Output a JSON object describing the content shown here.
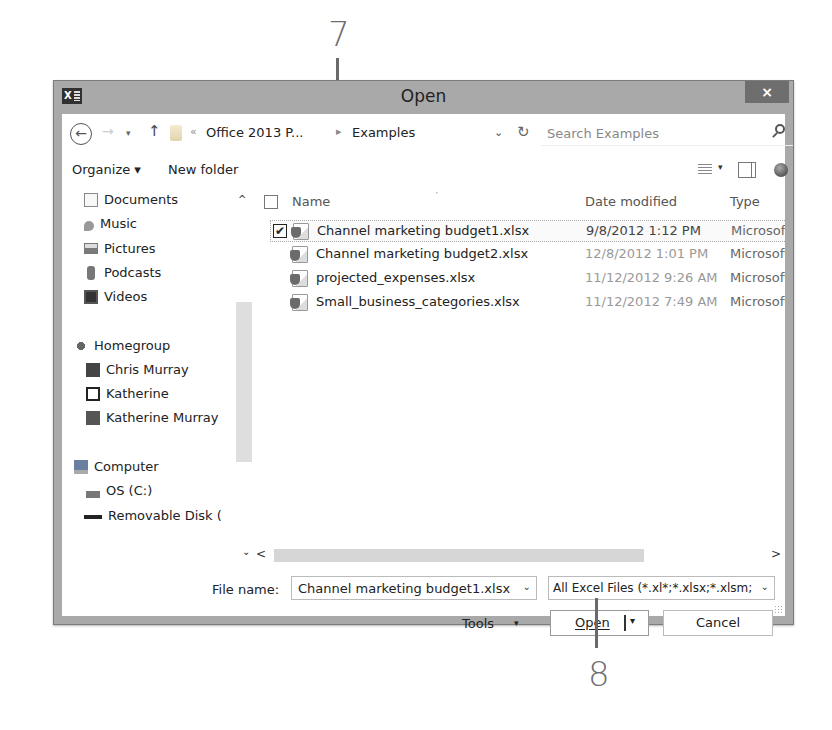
{
  "callouts": [
    {
      "number": "7",
      "target": "selected-file"
    },
    {
      "number": "8",
      "target": "open-button"
    }
  ],
  "window": {
    "title": "Open",
    "app_icon": "excel-icon",
    "close_label": "×"
  },
  "navbar": {
    "back_icon": "←",
    "forward_icon": "→",
    "recent_icon": "▾",
    "up_icon": "↑",
    "overflow": "«",
    "breadcrumbs": [
      "Office 2013 P...",
      "Examples"
    ],
    "separator": "▸",
    "dropdown_icon": "⌄",
    "refresh_icon": "↻",
    "search_placeholder": "Search Examples"
  },
  "toolbar": {
    "organize": "Organize ▾",
    "new_folder": "New folder",
    "view_dropdown": "▾"
  },
  "nav_pane": {
    "collapse_icon": "^",
    "items": [
      {
        "label": "Documents",
        "icon": "documents-icon",
        "indent": 1
      },
      {
        "label": "Music",
        "icon": "music-icon",
        "indent": 1
      },
      {
        "label": "Pictures",
        "icon": "pictures-icon",
        "indent": 1
      },
      {
        "label": "Podcasts",
        "icon": "podcasts-icon",
        "indent": 1
      },
      {
        "label": "Videos",
        "icon": "videos-icon",
        "indent": 1
      },
      {
        "label": "Homegroup",
        "icon": "homegroup-icon",
        "indent": 0
      },
      {
        "label": "Chris Murray",
        "icon": "user-icon",
        "indent": 1
      },
      {
        "label": "Katherine",
        "icon": "user-icon",
        "indent": 1
      },
      {
        "label": "Katherine Murray",
        "icon": "user-icon",
        "indent": 1
      },
      {
        "label": "Computer",
        "icon": "computer-icon",
        "indent": 0
      },
      {
        "label": "OS (C:)",
        "icon": "drive-icon",
        "indent": 1
      },
      {
        "label": "Removable Disk (",
        "icon": "usb-drive-icon",
        "indent": 1
      }
    ],
    "scroll_down_icon": "⌄"
  },
  "file_list": {
    "columns": [
      "Name",
      "Date modified",
      "Type"
    ],
    "files": [
      {
        "name": "Channel marketing budget1.xlsx",
        "date": "9/8/2012 1:12 PM",
        "type": "Microsoft",
        "selected": true,
        "checkmark": "✔"
      },
      {
        "name": "Channel marketing budget2.xlsx",
        "date": "12/8/2012 1:01 PM",
        "type": "Microsoft",
        "selected": false,
        "checkmark": ""
      },
      {
        "name": "projected_expenses.xlsx",
        "date": "11/12/2012 9:26 AM",
        "type": "Microsoft",
        "selected": false,
        "checkmark": ""
      },
      {
        "name": "Small_business_categories.xlsx",
        "date": "11/12/2012 7:49 AM",
        "type": "Microsoft",
        "selected": false,
        "checkmark": ""
      }
    ],
    "scroll_left_icon": "<",
    "scroll_right_icon": ">"
  },
  "footer": {
    "filename_label": "File name:",
    "filename_value": "Channel marketing budget1.xlsx",
    "combo_arrow": "⌄",
    "filter_value": "All Excel Files (*.xl*;*.xlsx;*.xlsm;",
    "tools_label": "Tools",
    "tools_arrow": "▾",
    "open_label": "Open",
    "open_arrow": "▾",
    "cancel_label": "Cancel"
  }
}
